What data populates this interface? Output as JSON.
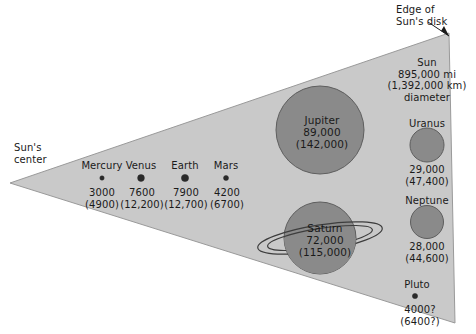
{
  "diagram": {
    "colors": {
      "background": "#ffffff",
      "wedge_fill": "#c9c9c9",
      "wedge_stroke": "#9a9a9a",
      "planet_fill": "#8a8a8a",
      "planet_stroke": "#5e5e5e",
      "text": "#1a1a1a",
      "ring_stroke": "#3d3d3d"
    },
    "annotations": {
      "sun_center": "Sun's\ncenter",
      "sun_center_line1": "Sun's",
      "sun_center_line2": "center",
      "edge_of_disk_line1": "Edge of",
      "edge_of_disk_line2": "Sun's disk"
    },
    "sun": {
      "name": "Sun",
      "diameter_mi": "895,000 mi",
      "diameter_km": "(1,392,000 km)",
      "unit_note": "diameter"
    },
    "planets_inner": [
      {
        "name": "Mercury",
        "diameter_mi": "3000",
        "diameter_km": "(4900)"
      },
      {
        "name": "Venus",
        "diameter_mi": "7600",
        "diameter_km": "(12,200)"
      },
      {
        "name": "Earth",
        "diameter_mi": "7900",
        "diameter_km": "(12,700)"
      },
      {
        "name": "Mars",
        "diameter_mi": "4200",
        "diameter_km": "(6700)"
      }
    ],
    "planets_giant": [
      {
        "name": "Jupiter",
        "diameter_mi": "89,000",
        "diameter_km": "(142,000)"
      },
      {
        "name": "Saturn",
        "diameter_mi": "72,000",
        "diameter_km": "(115,000)",
        "has_rings": true
      }
    ],
    "planets_outer": [
      {
        "name": "Uranus",
        "diameter_mi": "29,000",
        "diameter_km": "(47,400)"
      },
      {
        "name": "Neptune",
        "diameter_mi": "28,000",
        "diameter_km": "(44,600)"
      },
      {
        "name": "Pluto",
        "diameter_mi": "4000?",
        "diameter_km": "(6400?)"
      }
    ]
  }
}
